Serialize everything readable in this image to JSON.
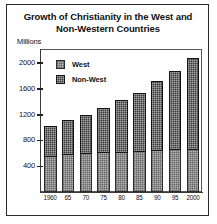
{
  "chart_data": {
    "type": "bar",
    "title": "Growth of Christianity in the West and Non-Western Countries",
    "title_line1": "Growth of Christianity in the West and",
    "title_line2": "Non-Western Countries",
    "xlabel": "",
    "ylabel": "Millions",
    "ylim": [
      0,
      2200
    ],
    "yticks": [
      400,
      800,
      1200,
      1600,
      2000
    ],
    "ytick_labels": [
      "400",
      "800",
      "1200",
      "1600",
      "2000"
    ],
    "grid": false,
    "stacked": true,
    "legend_position": "upper-left-inside",
    "categories": [
      "1960",
      "65",
      "70",
      "75",
      "80",
      "85",
      "90",
      "95",
      "2000"
    ],
    "series": [
      {
        "name": "West",
        "values": [
          540,
          570,
          590,
          600,
          610,
          620,
          640,
          645,
          650
        ]
      },
      {
        "name": "Non-West",
        "values": [
          480,
          540,
          610,
          700,
          810,
          910,
          1080,
          1225,
          1430
        ]
      }
    ],
    "totals": [
      1020,
      1110,
      1200,
      1300,
      1420,
      1530,
      1720,
      1870,
      2080
    ],
    "colors": {
      "west": "#b9b9b9",
      "nonwest": "#3a3a3a",
      "axis": "#3a3a3a",
      "text": "#111111"
    }
  },
  "legend": {
    "items": [
      {
        "label": "West",
        "swatch": "west-swatch"
      },
      {
        "label": "Non-West",
        "swatch": "nonwest-swatch"
      }
    ]
  }
}
